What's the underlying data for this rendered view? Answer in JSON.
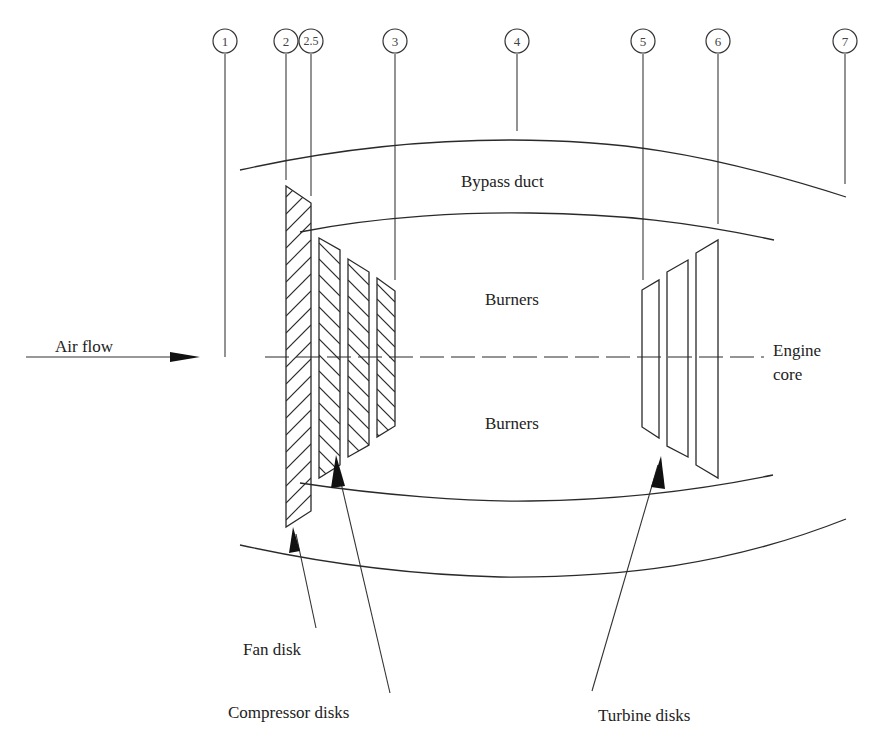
{
  "diagram": {
    "type": "turbofan-engine-cross-section",
    "stations": [
      {
        "id": "1",
        "label": "1",
        "x": 225
      },
      {
        "id": "2",
        "label": "2",
        "x": 286
      },
      {
        "id": "2.5",
        "label": "2.5",
        "x": 311
      },
      {
        "id": "3",
        "label": "3",
        "x": 395
      },
      {
        "id": "4",
        "label": "4",
        "x": 517
      },
      {
        "id": "5",
        "label": "5",
        "x": 643
      },
      {
        "id": "6",
        "label": "6",
        "x": 718
      },
      {
        "id": "7",
        "label": "7",
        "x": 845
      }
    ],
    "labels": {
      "air_flow": "Air flow",
      "bypass_duct": "Bypass duct",
      "burners_upper": "Burners",
      "burners_lower": "Burners",
      "engine_core_line1": "Engine",
      "engine_core_line2": "core",
      "fan_disk": "Fan disk",
      "compressor_disks": "Compressor disks",
      "turbine_disks": "Turbine disks"
    },
    "components": {
      "fan_disks": 1,
      "compressor_disks": 3,
      "turbine_disks": 3
    },
    "colors": {
      "line": "#2a2a2a",
      "background": "#ffffff",
      "text": "#222222"
    }
  }
}
